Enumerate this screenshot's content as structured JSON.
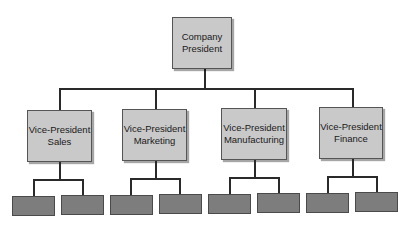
{
  "chart": {
    "root": {
      "line1": "Company",
      "line2": "President"
    },
    "vps": [
      {
        "line1": "Vice-President",
        "line2": "Sales"
      },
      {
        "line1": "Vice-President",
        "line2": "Marketing"
      },
      {
        "line1": "Vice-President",
        "line2": "Manufacturing"
      },
      {
        "line1": "Vice-President",
        "line2": "Finance"
      }
    ],
    "colors": {
      "box": "#c9c9c9",
      "leaf": "#7d7d7d",
      "line": "#2a2a2a"
    }
  }
}
